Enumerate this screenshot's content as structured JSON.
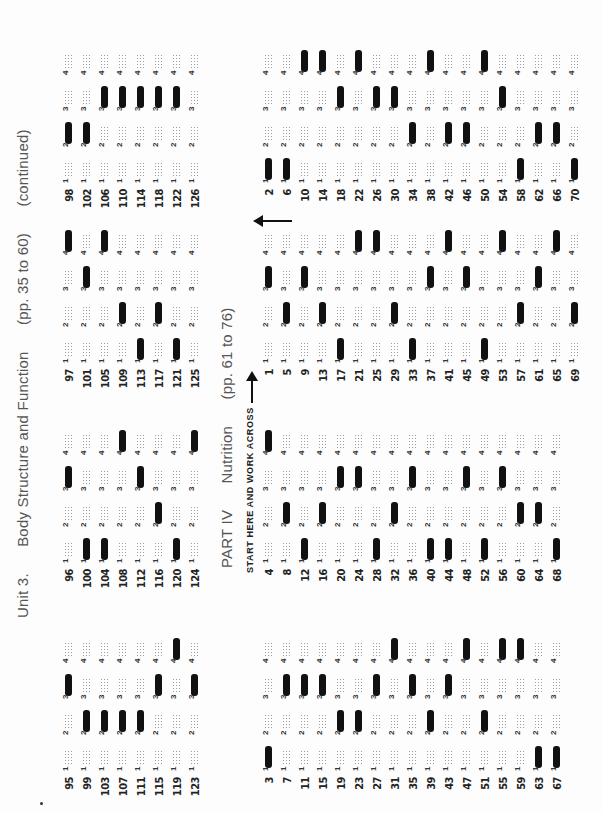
{
  "unit3": {
    "header": {
      "unit": "Unit 3.",
      "title": "Body Structure and Function",
      "pages": "(pp. 35 to 60)",
      "note": "(continued)"
    },
    "choice_labels": [
      "1",
      "2",
      "3",
      "4"
    ],
    "groups": [
      {
        "questions": [
          {
            "num": "95",
            "answer": 3
          },
          {
            "num": "99",
            "answer": 2
          },
          {
            "num": "103",
            "answer": 2
          },
          {
            "num": "107",
            "answer": 2
          },
          {
            "num": "111",
            "answer": 2
          },
          {
            "num": "115",
            "answer": 3
          },
          {
            "num": "119",
            "answer": 4
          },
          {
            "num": "123",
            "answer": 3
          }
        ]
      },
      {
        "questions": [
          {
            "num": "96",
            "answer": 3
          },
          {
            "num": "100",
            "answer": 1
          },
          {
            "num": "104",
            "answer": 1
          },
          {
            "num": "108",
            "answer": 4
          },
          {
            "num": "112",
            "answer": 3
          },
          {
            "num": "116",
            "answer": 2
          },
          {
            "num": "120",
            "answer": 1
          },
          {
            "num": "124",
            "answer": 4
          }
        ]
      },
      {
        "questions": [
          {
            "num": "97",
            "answer": 4
          },
          {
            "num": "101",
            "answer": 3
          },
          {
            "num": "105",
            "answer": 4
          },
          {
            "num": "109",
            "answer": 2
          },
          {
            "num": "113",
            "answer": 1
          },
          {
            "num": "117",
            "answer": 2
          },
          {
            "num": "121",
            "answer": 1
          },
          {
            "num": "125",
            "answer": null
          }
        ]
      },
      {
        "questions": [
          {
            "num": "98",
            "answer": 2
          },
          {
            "num": "102",
            "answer": 2
          },
          {
            "num": "106",
            "answer": 3
          },
          {
            "num": "110",
            "answer": 3
          },
          {
            "num": "114",
            "answer": 3
          },
          {
            "num": "118",
            "answer": 3
          },
          {
            "num": "122",
            "answer": 3
          },
          {
            "num": "126",
            "answer": null
          }
        ]
      }
    ]
  },
  "part4": {
    "header": {
      "part": "PART IV",
      "title": "Nutrition",
      "pages": "(pp. 61 to 76)"
    },
    "start_instruction": "START HERE AND WORK ACROSS",
    "choice_labels": [
      "1",
      "2",
      "3",
      "4"
    ],
    "groups": [
      {
        "questions": [
          {
            "num": "1",
            "answer": 3
          },
          {
            "num": "5",
            "answer": 2
          },
          {
            "num": "9",
            "answer": 3
          },
          {
            "num": "13",
            "answer": 2
          },
          {
            "num": "17",
            "answer": 1
          },
          {
            "num": "21",
            "answer": 4
          },
          {
            "num": "25",
            "answer": 4
          },
          {
            "num": "29",
            "answer": 2
          },
          {
            "num": "33",
            "answer": 1
          },
          {
            "num": "37",
            "answer": 3
          },
          {
            "num": "41",
            "answer": 4
          },
          {
            "num": "45",
            "answer": 3
          },
          {
            "num": "49",
            "answer": 1
          },
          {
            "num": "53",
            "answer": 4
          },
          {
            "num": "57",
            "answer": 2
          },
          {
            "num": "61",
            "answer": 3
          },
          {
            "num": "65",
            "answer": 4
          },
          {
            "num": "69",
            "answer": 2
          }
        ]
      },
      {
        "questions": [
          {
            "num": "2",
            "answer": 1
          },
          {
            "num": "6",
            "answer": 1
          },
          {
            "num": "10",
            "answer": 4
          },
          {
            "num": "14",
            "answer": 4
          },
          {
            "num": "18",
            "answer": 3
          },
          {
            "num": "22",
            "answer": 4
          },
          {
            "num": "26",
            "answer": 3
          },
          {
            "num": "30",
            "answer": 3
          },
          {
            "num": "34",
            "answer": 2
          },
          {
            "num": "38",
            "answer": 4
          },
          {
            "num": "42",
            "answer": 2
          },
          {
            "num": "46",
            "answer": 2
          },
          {
            "num": "50",
            "answer": 4
          },
          {
            "num": "54",
            "answer": 3
          },
          {
            "num": "58",
            "answer": 1
          },
          {
            "num": "62",
            "answer": 2
          },
          {
            "num": "66",
            "answer": 2
          },
          {
            "num": "70",
            "answer": 1
          }
        ]
      },
      {
        "questions": [
          {
            "num": "3",
            "answer": 1
          },
          {
            "num": "7",
            "answer": 3
          },
          {
            "num": "11",
            "answer": 3
          },
          {
            "num": "15",
            "answer": 3
          },
          {
            "num": "19",
            "answer": 2
          },
          {
            "num": "23",
            "answer": 2
          },
          {
            "num": "27",
            "answer": 3
          },
          {
            "num": "31",
            "answer": 4
          },
          {
            "num": "35",
            "answer": 3
          },
          {
            "num": "39",
            "answer": 2
          },
          {
            "num": "43",
            "answer": 3
          },
          {
            "num": "47",
            "answer": 4
          },
          {
            "num": "51",
            "answer": 2
          },
          {
            "num": "55",
            "answer": 4
          },
          {
            "num": "59",
            "answer": 4
          },
          {
            "num": "63",
            "answer": 1
          },
          {
            "num": "67",
            "answer": 1
          }
        ]
      },
      {
        "questions": [
          {
            "num": "4",
            "answer": 4
          },
          {
            "num": "8",
            "answer": 2
          },
          {
            "num": "12",
            "answer": 1
          },
          {
            "num": "16",
            "answer": 2
          },
          {
            "num": "20",
            "answer": 3
          },
          {
            "num": "24",
            "answer": 3
          },
          {
            "num": "28",
            "answer": 1
          },
          {
            "num": "32",
            "answer": 2
          },
          {
            "num": "36",
            "answer": 3
          },
          {
            "num": "40",
            "answer": 1
          },
          {
            "num": "44",
            "answer": 1
          },
          {
            "num": "48",
            "answer": 3
          },
          {
            "num": "52",
            "answer": 1
          },
          {
            "num": "56",
            "answer": 3
          },
          {
            "num": "60",
            "answer": 2
          },
          {
            "num": "64",
            "answer": 2
          },
          {
            "num": "68",
            "answer": 1
          }
        ]
      }
    ]
  }
}
